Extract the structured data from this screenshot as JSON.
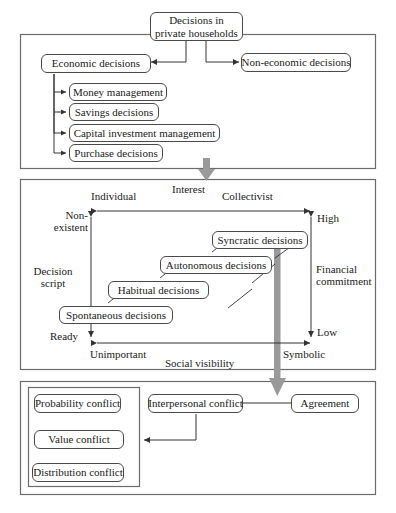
{
  "diagram": {
    "colors": {
      "box_border": "#4a4a4a",
      "panel_border": "#6b6b6b",
      "connector": "#333333",
      "flow_arrow": "#9a9a9a",
      "background": "#ffffff"
    }
  },
  "panel_top": {
    "root": "Decisions in private households",
    "economic": "Economic decisions",
    "non_economic": "Non-economic decisions",
    "economic_children": [
      "Money management",
      "Savings decisions",
      "Capital investment management",
      "Purchase decisions"
    ]
  },
  "panel_middle": {
    "axes": {
      "top_axis_label": "Interest",
      "top_axis_left": "Individual",
      "top_axis_right": "Collectivist",
      "left_axis_label": "Decision script",
      "left_axis_label_line1": "Decision",
      "left_axis_label_line2": "script",
      "left_axis_top": "Non-existent",
      "left_axis_top_line1": "Non-",
      "left_axis_top_line2": "existent",
      "left_axis_bottom": "Ready",
      "right_axis_label_line1": "Financial",
      "right_axis_label_line2": "commitment",
      "right_axis_top": "High",
      "right_axis_bottom": "Low",
      "bottom_axis_label": "Social visibility",
      "bottom_axis_left": "Unimportant",
      "bottom_axis_right": "Symbolic"
    },
    "decision_types": [
      "Syncratic decisions",
      "Autonomous decisions",
      "Habitual decisions",
      "Spontaneous decisions"
    ]
  },
  "panel_bottom": {
    "interpersonal": "Interpersonal conflict",
    "agreement": "Agreement",
    "conflicts": [
      "Probability conflict",
      "Value conflict",
      "Distribution conflict"
    ]
  }
}
